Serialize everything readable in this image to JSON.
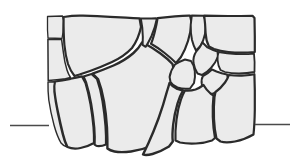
{
  "figure": {
    "caption": "",
    "background_color": "#ffffff",
    "stone_fill_color": "#ebebeb",
    "stone_outline_color": "#2b2b2b",
    "datum_line_color": "#4a4a4a",
    "canvas": {
      "width": 296,
      "height": 167
    }
  },
  "datum_lines": [
    {
      "name": "left-grade-line",
      "x1": 10,
      "y1": 125.5,
      "x2": 49,
      "y2": 125.5,
      "stroke_width": 1.6
    },
    {
      "name": "right-grade-line",
      "x1": 255,
      "y1": 124.5,
      "x2": 290,
      "y2": 124.5,
      "stroke_width": 1.6
    }
  ],
  "stones": [
    {
      "id": "stone-01",
      "label": "small top-left block",
      "stroke_width": 1.3,
      "path": "M47.5,16.5 L62.5,16.0 L63.5,20.5 L63.0,32.0 L62.0,38.5 L48.0,38.0 L47.5,30.0 Z"
    },
    {
      "id": "stone-02",
      "label": "upper-left large block",
      "stroke_width": 2.2,
      "path": "M63.6,17.0 Q74,15.2 83,15.6 Q98,16.1 110,16.8 L126,17.6 Q134,18.0 139.5,18.4 L141.0,27.0 Q138.5,39.0 132.0,48.0 Q124.0,56.5 112.0,62.0 Q100.0,67.5 90.0,71.0 Q84.0,73.0 79.5,74.5 L74.5,76.0 Q70.5,71.0 68.0,64.0 Q65.5,56.0 64.4,45.0 Q63.4,33.0 63.6,17.0 Z"
    },
    {
      "id": "stone-03",
      "label": "left wedge under big block",
      "stroke_width": 1.5,
      "path": "M47.9,39.2 L61.6,39.4 Q62.6,47.0 63.6,54.0 Q64.6,62.5 67.0,70.0 Q68.5,74.5 70.5,77.5 L65.5,78.8 Q57.0,80.0 48.2,80.6 Z"
    },
    {
      "id": "stone-04",
      "label": "left lower large stone",
      "stroke_width": 2.2,
      "path": "M70.6,78.8 Q76.0,77.6 82.0,76.4 L85.5,83.0 Q88.5,93.0 90.5,104.0 Q92.5,116.0 93.5,127.0 Q94.2,136.0 94.0,143.0 Q88.0,146.5 80.5,148.0 Q73.0,149.5 67.5,147.0 Q65.0,142.0 63.0,134.0 Q60.5,124.0 58.0,112.0 Q55.5,100.0 54.5,91.0 Q54.0,85.0 55.0,81.5 Q62.0,80.5 70.6,78.8 Z"
    },
    {
      "id": "stone-05",
      "label": "left bottom small sliver",
      "stroke_width": 1.4,
      "path": "M54.6,81.8 Q53.5,86.0 54.0,92.0 Q55.0,101.0 57.4,112.5 Q59.8,124.5 62.4,134.5 Q64.2,141.5 66.6,146.8 Q63.5,146.0 61.0,143.0 Q57.0,136.0 54.0,125.0 Q50.5,112.0 48.8,100.0 Q47.8,91.0 48.0,82.0 Z"
    },
    {
      "id": "stone-06",
      "label": "center-left tall stone",
      "stroke_width": 2.2,
      "path": "M83.5,76.5 Q87.0,75.4 91.5,74.0 L97.0,79.0 Q100.5,89.0 102.5,101.0 Q104.5,113.5 105.5,126.0 Q106.2,136.0 106.0,144.5 Q101.5,146.5 97.0,146.0 Q95.5,145.6 94.6,144.6 Q95.0,137.0 94.3,127.5 Q93.2,116.0 91.2,104.0 Q89.2,92.5 86.2,82.8 Z"
    },
    {
      "id": "stone-07",
      "label": "center large keystone",
      "stroke_width": 2.4,
      "path": "M92.5,73.6 Q102.0,70.4 113.5,65.5 Q125.0,60.4 133.5,53.0 Q139.0,48.0 142.0,42.5 L145.5,44.0 Q153.0,48.0 160.5,53.5 Q168.0,59.0 172.5,64.0 L174.0,70.0 Q172.5,82.0 169.0,96.0 Q165.0,111.5 160.0,125.0 Q155.5,137.0 151.0,146.0 Q142.0,150.0 131.0,151.5 Q121.0,152.8 114.5,151.5 Q110.0,150.5 107.4,148.5 Q107.5,139.0 107.0,127.5 Q106.2,114.5 104.0,101.5 Q102.0,89.5 98.0,79.0 Z"
    },
    {
      "id": "stone-08",
      "label": "upper-center block",
      "stroke_width": 2.0,
      "path": "M140.8,18.5 Q149.0,18.7 156.0,18.3 L156.8,19.0 Q155.0,28.0 151.5,36.0 Q148.0,43.5 145.6,46.8 L142.6,44.8 Q143.2,37.0 142.3,28.0 Z"
    },
    {
      "id": "stone-09",
      "label": "upper-center-right block",
      "stroke_width": 2.2,
      "path": "M157.6,18.2 Q166.0,17.3 175.0,16.4 Q184.0,15.5 190.0,15.6 L191.5,22.0 Q190.8,32.0 188.0,41.0 Q185.0,50.5 181.0,57.0 L176.0,63.0 Q171.0,58.0 164.0,52.5 Q157.5,47.5 151.0,43.8 Q152.5,40.5 154.5,33.0 Q156.6,25.0 157.6,18.2 Z"
    },
    {
      "id": "stone-10",
      "label": "top-right corner block",
      "stroke_width": 2.0,
      "path": "M191.8,15.4 Q198.0,15.4 203.5,15.8 L205.5,20.0 Q206.5,27.0 205.0,34.0 Q203.5,41.0 200.5,46.0 L196.0,50.5 Q193.5,46.0 192.0,40.0 Q190.5,33.0 190.7,25.0 Z"
    },
    {
      "id": "stone-11",
      "label": "right upper large block",
      "stroke_width": 2.2,
      "path": "M204.2,15.6 Q216.0,16.0 228.0,16.0 Q241.0,16.0 252.5,15.8 L254.5,18.0 L254.8,36.0 L254.8,52.0 L248.0,52.5 Q238.0,53.0 228.5,52.0 Q220.0,51.0 214.0,49.0 L209.0,46.5 Q206.0,41.0 205.6,33.0 Q205.3,24.0 204.2,15.6 Z"
    },
    {
      "id": "stone-12",
      "label": "mid small polygon A",
      "stroke_width": 2.0,
      "path": "M196.4,51.2 Q200.0,47.5 202.5,42.5 L207.5,47.5 Q212.0,50.0 217.5,51.6 L218.0,56.5 Q215.5,63.0 211.0,68.0 Q206.5,73.0 202.0,75.0 L197.5,73.5 Q194.5,69.0 193.5,63.0 Q192.8,56.5 196.4,51.2 Z"
    },
    {
      "id": "stone-13",
      "label": "mid small polygon B",
      "stroke_width": 1.8,
      "path": "M218.6,52.0 Q227.0,53.6 236.0,54.0 Q245.5,54.4 254.0,53.6 L254.6,62.0 L254.5,72.0 Q247.0,73.5 239.0,73.5 Q231.0,73.5 225.0,72.0 L220.5,70.0 Q218.0,66.0 217.6,60.0 Q217.4,55.5 218.6,52.0 Z"
    },
    {
      "id": "stone-14",
      "label": "center small rounded stone",
      "stroke_width": 2.0,
      "path": "M175.0,64.5 Q179.5,61.5 185.0,59.5 L191.0,61.0 Q194.0,65.0 194.8,71.0 Q195.5,77.5 194.0,83.0 L190.0,88.5 Q183.5,89.5 177.5,87.5 Q172.5,85.5 170.5,82.0 L169.6,77.0 Q170.5,70.5 175.0,64.5 Z"
    },
    {
      "id": "stone-15",
      "label": "mid-right polygon C",
      "stroke_width": 2.0,
      "path": "M203.0,76.0 Q207.5,74.0 212.0,69.5 L216.5,71.5 Q221.5,73.5 227.0,74.5 L228.0,78.5 Q226.0,84.0 221.5,88.5 Q217.0,92.5 212.0,94.0 L206.5,93.0 Q203.0,89.5 201.8,84.0 Q201.0,79.0 203.0,76.0 Z"
    },
    {
      "id": "stone-16",
      "label": "right lower large block",
      "stroke_width": 2.2,
      "path": "M228.8,75.0 Q236.5,76.0 244.5,75.5 Q250.0,75.2 254.4,74.2 L254.8,90.0 L254.8,110.0 Q254.6,124.0 253.5,134.5 Q245.0,139.5 235.0,141.5 Q226.0,143.2 220.5,141.5 L216.5,138.5 Q214.5,130.0 214.0,119.0 Q213.5,107.0 214.5,97.0 L215.5,92.0 Q221.0,88.0 225.0,82.5 Q227.8,78.8 228.8,75.0 Z"
    },
    {
      "id": "stone-17",
      "label": "lower-center-right block",
      "stroke_width": 2.2,
      "path": "M195.5,89.5 Q199.5,88.0 203.5,85.0 Q206.0,89.5 210.5,93.5 L213.5,95.5 Q212.5,105.0 212.8,117.0 Q213.2,129.0 215.0,138.0 L212.0,140.5 Q205.0,143.0 196.0,143.5 Q187.0,144.0 180.0,142.5 L175.5,140.5 Q175.0,131.0 176.5,119.5 Q178.0,108.0 181.0,99.5 Q183.0,94.0 185.0,90.5 Q190.5,91.0 195.5,89.5 Z"
    },
    {
      "id": "stone-18",
      "label": "bottom-center large stone",
      "stroke_width": 2.4,
      "path": "M169.5,83.0 Q172.0,86.0 176.5,88.5 L183.0,90.5 Q180.0,95.5 177.5,103.5 Q174.5,113.5 173.2,124.5 Q172.0,135.0 172.8,141.5 L169.0,146.5 Q161.0,151.5 152.5,154.0 Q146.0,155.8 143.0,154.5 Q145.0,150.5 148.5,143.0 Q153.5,132.0 158.5,118.5 Q163.5,104.5 166.8,92.0 Q168.6,86.5 169.5,83.0 Z"
    }
  ]
}
